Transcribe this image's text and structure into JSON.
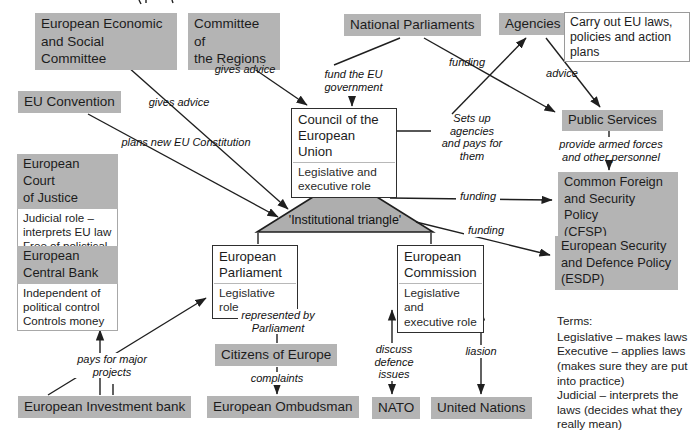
{
  "nodes": {
    "eesc": "European Economic\nand Social Committee",
    "cor": "Committee of\nthe Regions",
    "national_parliaments": "National Parliaments",
    "agencies": "Agencies",
    "agencies_note": "Carry out EU laws,\npolicies and action\nplans",
    "eu_convention": "EU Convention",
    "council": {
      "title": "Council of the\nEuropean Union",
      "role": "Legislative and\nexecutive role"
    },
    "public_services": "Public Services",
    "ecj": {
      "title": "European Court\nof Justice",
      "body": "Judicial role –\ninterprets EU law\nFree of polictical\ncontrol"
    },
    "cfsp": "Common Foreign\nand Security Policy\n(CFSP)",
    "ecb": {
      "title": "European\nCentral Bank",
      "body": "Independent of\npolitical control\nControls money"
    },
    "esdp": "European Security\nand Defence Policy\n(ESDP)",
    "triangle_label": "'Institutional triangle'",
    "parliament": {
      "title": "European\nParliament",
      "role": "Legislative role"
    },
    "commission": {
      "title": "European\nCommission",
      "role": "Legislative and\nexecutive role"
    },
    "citizens": "Citizens of Europe",
    "ombudsman": "European Ombudsman",
    "eib": "European Investment bank",
    "nato": "NATO",
    "un": "United Nations"
  },
  "edge_labels": {
    "gives_advice_eesc": "gives advice",
    "gives_advice_cor": "gives advice",
    "fund_eu_gov": "fund the EU\ngovernment",
    "funding_public_services": "funding",
    "advice": "advice",
    "plans_constitution": "plans new EU Constitution",
    "sets_up_agencies": "Sets up agencies\nand pays for them",
    "provide_forces": "provide armed forces\nand other personnel",
    "funding_cfsp": "funding",
    "funding_esdp": "funding",
    "represented_by": "represented by\nParliament",
    "complaints": "complaints",
    "discuss_defence": "discuss defence\nissues",
    "liasion": "liasion",
    "pays_major": "pays for major\nprojects"
  },
  "terms": {
    "title": "Terms:",
    "body": "Legislative – makes laws\nExecutive – applies laws\n(makes sure they are put\ninto practice)\nJudicial – interprets the\nlaws (decides what they\nreally mean)"
  },
  "colors": {
    "box_gray": "#b4b4b4",
    "triangle_fill": "#aeaeae",
    "line": "#1f1f1f"
  }
}
